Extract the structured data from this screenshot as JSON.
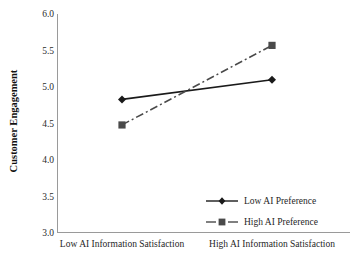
{
  "chart_data": {
    "type": "line",
    "title": "",
    "subtitle": "",
    "xlabel": "",
    "ylabel": "Customer Engagement",
    "categories": [
      "Low AI Information Satisfaction",
      "High AI Information Satisfaction"
    ],
    "yticks": [
      "6.0",
      "5.5",
      "5.0",
      "4.5",
      "4.0",
      "3.5",
      "3.0"
    ],
    "ytick_values": [
      6.0,
      5.5,
      5.0,
      4.5,
      4.0,
      3.5,
      3.0
    ],
    "ylim": [
      3.0,
      6.0
    ],
    "grid": false,
    "legend_position": "inside lower-right",
    "series": [
      {
        "name": "Low AI Preference",
        "values": [
          4.83,
          5.1
        ],
        "marker": "diamond",
        "linestyle": "solid",
        "color": "#1a1a1a"
      },
      {
        "name": "High AI Preference",
        "values": [
          4.48,
          5.57
        ],
        "marker": "square",
        "linestyle": "dash-dot",
        "color": "#4a4a4a"
      }
    ],
    "annotations": [],
    "axis_color": "#9a9a9a",
    "background": "#ffffff"
  },
  "legend": {
    "items": [
      {
        "label": "Low AI Preference"
      },
      {
        "label": "High AI Preference"
      }
    ]
  }
}
